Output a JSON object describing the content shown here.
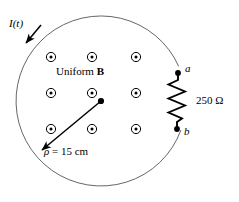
{
  "figure": {
    "background_color": "#ffffff",
    "stroke_color": "#000000",
    "loop": {
      "center_x": 101,
      "center_y": 101,
      "radius": 85,
      "gap_start_deg": -24,
      "gap_end_deg": 20
    },
    "labels": {
      "current": "I(t)",
      "field_prefix": "Uniform ",
      "field_symbol": "B",
      "radius_symbol": "ρ",
      "radius_equals": " = 15 cm",
      "resistance": "250 Ω",
      "terminal_a": "a",
      "terminal_b": "b"
    },
    "field_markers": {
      "symbol": "circle-dot-out-of-page",
      "count": 9,
      "positions": [
        {
          "x": 51,
          "y": 57
        },
        {
          "x": 92,
          "y": 57
        },
        {
          "x": 136,
          "y": 57
        },
        {
          "x": 51,
          "y": 93
        },
        {
          "x": 92,
          "y": 93
        },
        {
          "x": 136,
          "y": 93
        },
        {
          "x": 51,
          "y": 129
        },
        {
          "x": 92,
          "y": 129
        },
        {
          "x": 136,
          "y": 129
        }
      ],
      "outer_radius": 4.6,
      "inner_radius": 1.5
    },
    "radius_arrow": {
      "from_x": 101,
      "from_y": 101,
      "to_x": 40,
      "to_y": 152
    },
    "current_arrow": {
      "from_x": 40,
      "from_y": 25,
      "to_x": 24,
      "to_y": 44
    },
    "resistor": {
      "terminal_a": {
        "x": 178,
        "y": 73
      },
      "terminal_b": {
        "x": 177,
        "y": 129
      },
      "terminal_dot_radius": 2.8,
      "zigzag_points": "178,73 178,81 169,85 185,92 169,99 185,106 169,113 182,119 177,123 177,129",
      "stroke_width": 1.9
    }
  }
}
